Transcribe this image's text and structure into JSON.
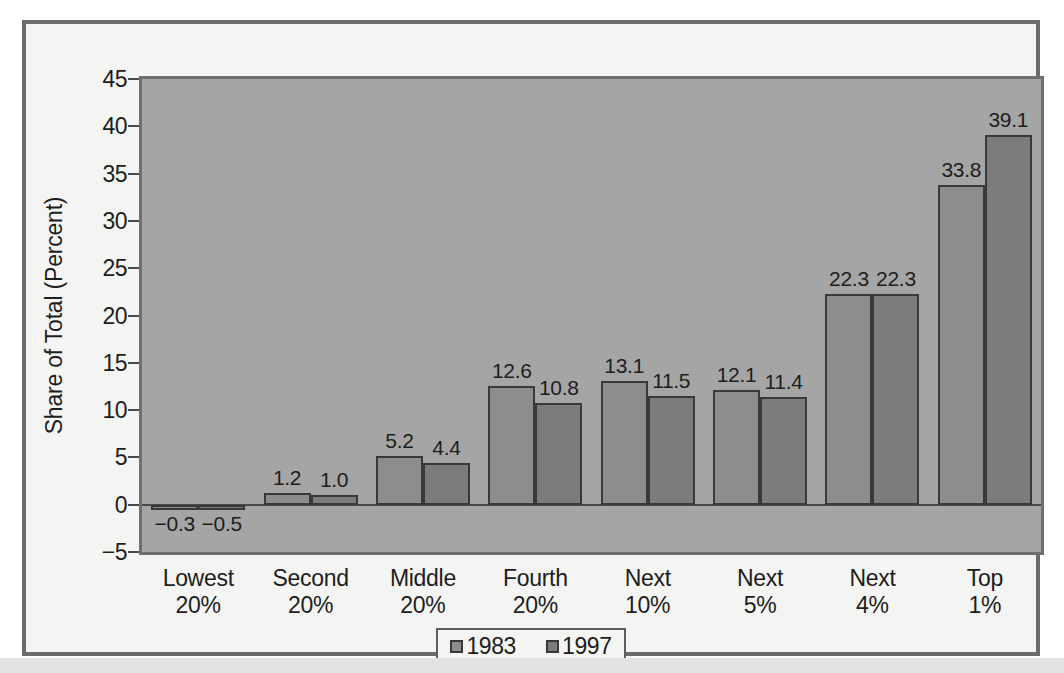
{
  "chart_data": {
    "type": "bar",
    "title": "",
    "xlabel": "",
    "ylabel": "Share of Total (Percent)",
    "ylim": [
      -5,
      45
    ],
    "yticks": [
      -5,
      0,
      5,
      10,
      15,
      20,
      25,
      30,
      35,
      40,
      45
    ],
    "ytick_labels": [
      "−5",
      "0",
      "5",
      "10",
      "15",
      "20",
      "25",
      "30",
      "35",
      "40",
      "45"
    ],
    "grid": false,
    "legend_position": "bottom",
    "categories": [
      {
        "line1": "Lowest",
        "line2": "20%"
      },
      {
        "line1": "Second",
        "line2": "20%"
      },
      {
        "line1": "Middle",
        "line2": "20%"
      },
      {
        "line1": "Fourth",
        "line2": "20%"
      },
      {
        "line1": "Next",
        "line2": "10%"
      },
      {
        "line1": "Next",
        "line2": "5%"
      },
      {
        "line1": "Next",
        "line2": "4%"
      },
      {
        "line1": "Top",
        "line2": "1%"
      }
    ],
    "series": [
      {
        "name": "1983",
        "color": "#8d8d8d",
        "values": [
          -0.3,
          1.2,
          5.2,
          12.6,
          13.1,
          12.1,
          22.3,
          33.8
        ],
        "labels": [
          "−0.3",
          "1.2",
          "5.2",
          "12.6",
          "13.1",
          "12.1",
          "22.3",
          "33.8"
        ]
      },
      {
        "name": "1997",
        "color": "#7c7c7c",
        "values": [
          -0.5,
          1.0,
          4.4,
          10.8,
          11.5,
          11.4,
          22.3,
          39.1
        ],
        "labels": [
          "−0.5",
          "1.0",
          "4.4",
          "10.8",
          "11.5",
          "11.4",
          "22.3",
          "39.1"
        ]
      }
    ]
  },
  "legend": {
    "items": [
      {
        "label": "1983",
        "color": "#8d8d8d"
      },
      {
        "label": "1997",
        "color": "#7c7c7c"
      }
    ]
  },
  "colors": {
    "plot_background": "#a5a5a5",
    "figure_background": "#f4f4f2",
    "frame": "#6b6b6b",
    "bar_1983": "#8d8d8d",
    "bar_1997": "#7c7c7c",
    "text": "#1d1d1d"
  }
}
